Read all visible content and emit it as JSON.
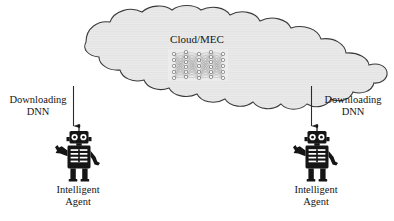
{
  "figure": {
    "type": "diagram",
    "background_color": "#ffffff",
    "ink_color": "#151515",
    "cloud": {
      "label": "Cloud/MEC",
      "fill_color": "#e9e9e9",
      "stroke_color": "#3a3a3a",
      "contents_icon": "neural-network-icon",
      "neural_network": {
        "layers": [
          5,
          6,
          5,
          6,
          5
        ],
        "node_color": "#f2f2f2",
        "edge_color": "#9a9a9a",
        "panel_fill": "#ededed"
      }
    },
    "edges": [
      {
        "label": "Downloading\nDNN",
        "direction": "down",
        "from": "cloud",
        "to": "intelligent-agent-left",
        "side": "left"
      },
      {
        "label": "Downloading\nDNN",
        "direction": "down",
        "from": "cloud",
        "to": "intelligent-agent-right",
        "side": "right"
      }
    ],
    "agents": [
      {
        "label": "Intelligent\nAgent",
        "icon": "robot-icon",
        "side": "left",
        "color": "#151515"
      },
      {
        "label": "Intelligent\nAgent",
        "icon": "robot-icon",
        "side": "right",
        "color": "#151515"
      }
    ]
  }
}
